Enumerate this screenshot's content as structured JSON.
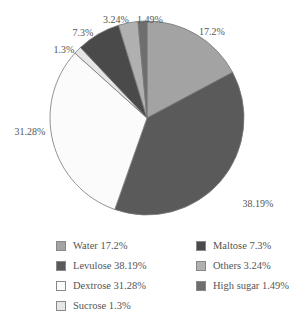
{
  "chart_data": {
    "type": "pie",
    "title": "",
    "start_angle_deg": 0,
    "direction": "clockwise",
    "slices": [
      {
        "name": "Water",
        "value": 17.2,
        "label": "17.2%",
        "legend": "Water 17.2%",
        "color": "#a3a3a3"
      },
      {
        "name": "Levulose",
        "value": 38.19,
        "label": "38.19%",
        "legend": "Levulose 38.19%",
        "color": "#5a5a5a"
      },
      {
        "name": "Dextrose",
        "value": 31.28,
        "label": "31.28%",
        "legend": "Dextrose 31.28%",
        "color": "#fbfbfb"
      },
      {
        "name": "Sucrose",
        "value": 1.3,
        "label": "1.3%",
        "legend": "Sucrose 1.3%",
        "color": "#e6e6e6"
      },
      {
        "name": "Maltose",
        "value": 7.3,
        "label": "7.3%",
        "legend": "Maltose 7.3%",
        "color": "#4a4a4a"
      },
      {
        "name": "Others",
        "value": 3.24,
        "label": "3.24%",
        "legend": "Others 3.24%",
        "color": "#b0b0b0"
      },
      {
        "name": "High sugar",
        "value": 1.49,
        "label": "1.49%",
        "legend": "High sugar 1.49%",
        "color": "#6e6e6e"
      }
    ],
    "legend_position": "bottom"
  },
  "legend": {
    "items": [
      {
        "text": "Water 17.2%"
      },
      {
        "text": "Levulose 38.19%"
      },
      {
        "text": "Dextrose 31.28%"
      },
      {
        "text": "Sucrose 1.3%"
      },
      {
        "text": "Maltose 7.3%"
      },
      {
        "text": "Others 3.24%"
      },
      {
        "text": "High sugar 1.49%"
      }
    ]
  }
}
